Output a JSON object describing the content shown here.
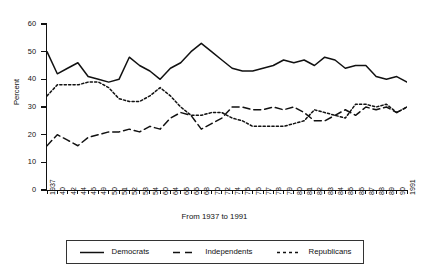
{
  "chart_data": {
    "type": "line",
    "title": "",
    "xlabel": "From 1937 to 1991",
    "ylabel": "Percent",
    "ylim": [
      0,
      60
    ],
    "y_ticks": [
      0,
      10,
      20,
      30,
      40,
      50,
      60
    ],
    "grid": false,
    "legend_position": "bottom",
    "categories": [
      "1937",
      "40",
      "42",
      "44",
      "46",
      "49",
      "50",
      "51",
      "52",
      "53",
      "54",
      "60",
      "64",
      "65",
      "66",
      "68",
      "70",
      "72",
      "74",
      "75",
      "76",
      "77",
      "78",
      "79",
      "80",
      "81",
      "82",
      "83",
      "84",
      "85",
      "86",
      "87",
      "88",
      "89",
      "90",
      "1991"
    ],
    "series": [
      {
        "name": "Democrats",
        "style": "solid",
        "values": [
          50,
          42,
          44,
          46,
          41,
          40,
          39,
          40,
          48,
          45,
          43,
          40,
          44,
          46,
          50,
          53,
          50,
          47,
          44,
          43,
          43,
          44,
          45,
          47,
          46,
          47,
          45,
          48,
          47,
          44,
          45,
          45,
          41,
          40,
          41,
          39
        ]
      },
      {
        "name": "Independents",
        "style": "dashed",
        "values": [
          16,
          20,
          18,
          16,
          19,
          20,
          21,
          21,
          22,
          21,
          23,
          22,
          26,
          28,
          27,
          22,
          24,
          26,
          30,
          30,
          29,
          29,
          30,
          29,
          30,
          28,
          25,
          25,
          27,
          29,
          27,
          30,
          29,
          30,
          28,
          30
        ]
      },
      {
        "name": "Republicans",
        "style": "dotted",
        "values": [
          34,
          38,
          38,
          38,
          39,
          39,
          37,
          33,
          32,
          32,
          34,
          37,
          34,
          30,
          27,
          27,
          28,
          28,
          26,
          25,
          23,
          23,
          23,
          23,
          24,
          25,
          29,
          28,
          27,
          26,
          31,
          31,
          30,
          31,
          28,
          30
        ]
      }
    ]
  },
  "legend": {
    "items": [
      {
        "label": "Democrats"
      },
      {
        "label": "Independents"
      },
      {
        "label": "Republicans"
      }
    ]
  }
}
